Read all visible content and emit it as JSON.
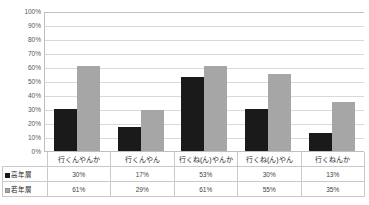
{
  "chart_data": {
    "type": "bar",
    "title": "",
    "xlabel": "",
    "ylabel": "",
    "ylim": [
      0,
      100
    ],
    "grid": true,
    "legend_position": "table-left",
    "categories": [
      "行くんやんか",
      "行くんやん",
      "行くね(ん)やんか",
      "行くね(ん)やん",
      "行くねんか"
    ],
    "series": [
      {
        "name": "高年層",
        "marker": "filled-square",
        "color": "#1a1a1a",
        "values": [
          30,
          17,
          53,
          30,
          13
        ]
      },
      {
        "name": "若年層",
        "marker": "outlined-square",
        "color": "#a6a6a6",
        "values": [
          61,
          29,
          61,
          55,
          35
        ]
      }
    ],
    "value_labels": [
      [
        "30%",
        "17%",
        "53%",
        "30%",
        "13%"
      ],
      [
        "61%",
        "29%",
        "61%",
        "55%",
        "35%"
      ]
    ],
    "y_ticks": [
      "100%",
      "90%",
      "80%",
      "70%",
      "60%",
      "50%",
      "40%",
      "30%",
      "20%",
      "10%",
      "0%"
    ],
    "y_tick_values": [
      100,
      90,
      80,
      70,
      60,
      50,
      40,
      30,
      20,
      10,
      0
    ]
  },
  "colors": {
    "series_high": "#1a1a1a",
    "series_young": "#a6a6a6",
    "gridline": "#d9d9d9",
    "axis": "#bfbfbf",
    "table_border": "#c9c9c9",
    "text": "#262626",
    "background": "#ffffff"
  }
}
